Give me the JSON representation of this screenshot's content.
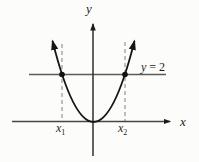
{
  "figure": {
    "colors": {
      "background": "#fcfcfa",
      "ink": "#1c1c1c",
      "axis": "#2f2f2f",
      "horizontal_line": "#5a5a5a",
      "dashed_guide": "#8b8b8b"
    },
    "labels": {
      "y_axis": "y",
      "x_axis": "x",
      "line_equation": {
        "var": "y",
        "rest": " = 2"
      },
      "x1": {
        "base": "x",
        "sub": "1"
      },
      "x2": {
        "base": "x",
        "sub": "2"
      }
    }
  }
}
